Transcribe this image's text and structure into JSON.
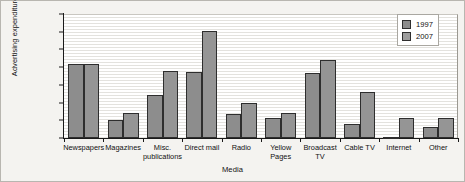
{
  "chart_data": {
    "type": "bar",
    "title": "",
    "xlabel": "Media",
    "ylabel": "Advertising expenditure ($m)",
    "ylim": [
      0,
      70000
    ],
    "ytick_labels": [
      "70000",
      "60000",
      "50000",
      "40000",
      "30000",
      "20000",
      "10000",
      "0"
    ],
    "ytick_values": [
      70000,
      60000,
      50000,
      40000,
      30000,
      20000,
      10000,
      0
    ],
    "grid": true,
    "legend_position": "top-right",
    "categories": [
      "Newspapers",
      "Magazines",
      "Misc.\npublications",
      "Direct mail",
      "Radio",
      "Yellow\nPages",
      "Broadcast\nTV",
      "Cable TV",
      "Internet",
      "Other"
    ],
    "series": [
      {
        "name": "1997",
        "color": "#8d8d8d",
        "values": [
          41500,
          10000,
          24000,
          37000,
          13500,
          11500,
          36500,
          8000,
          800,
          6000
        ]
      },
      {
        "name": "2007",
        "color": "#9d9d9d",
        "values": [
          42000,
          14000,
          38000,
          60500,
          19500,
          14000,
          44000,
          26000,
          11500,
          11500
        ]
      }
    ]
  },
  "legend": {
    "items": [
      {
        "label": "1997"
      },
      {
        "label": "2007"
      }
    ]
  }
}
